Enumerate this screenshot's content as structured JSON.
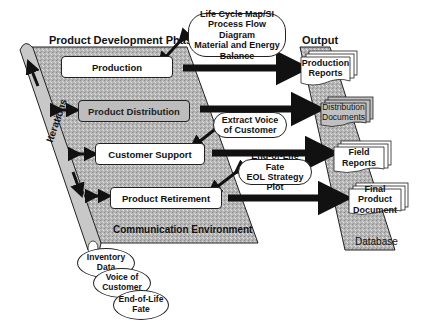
{
  "diagram": {
    "phase_title": "Product Development Phase",
    "output_title": "Output",
    "iterations_label": "Iterations",
    "communication_label": "Communication Environment",
    "database_label": "Database",
    "phases": [
      {
        "label": "Production",
        "style": "white"
      },
      {
        "label": "Product Distribution",
        "style": "shaded"
      },
      {
        "label": "Customer Support",
        "style": "white"
      },
      {
        "label": "Product Retirement",
        "style": "white"
      }
    ],
    "tools": [
      {
        "line1": "Life Cycle Map/SI",
        "line2": "Process Flow Diagram",
        "line3": "Material and Energy Balance"
      },
      {
        "line1": "Extract Voice",
        "line2": "of Customer"
      },
      {
        "line1": "End-of-Life Fate",
        "line2": "EOL Strategy Plot"
      }
    ],
    "outputs": [
      {
        "line1": "Production",
        "line2": "Reports"
      },
      {
        "line1": "Distribution",
        "line2": "Documents"
      },
      {
        "line1": "Field",
        "line2": "Reports"
      },
      {
        "line1": "Final Product",
        "line2": "Document"
      }
    ],
    "data_stores": [
      {
        "line1": "Inventory",
        "line2": "Data"
      },
      {
        "line1": "Voice of",
        "line2": "Customer"
      },
      {
        "line1": "End-of-Life",
        "line2": "Fate"
      }
    ],
    "colors": {
      "panel_fill": "#b8b8b8",
      "stroke": "#111111",
      "box_fill": "#ffffff"
    }
  }
}
